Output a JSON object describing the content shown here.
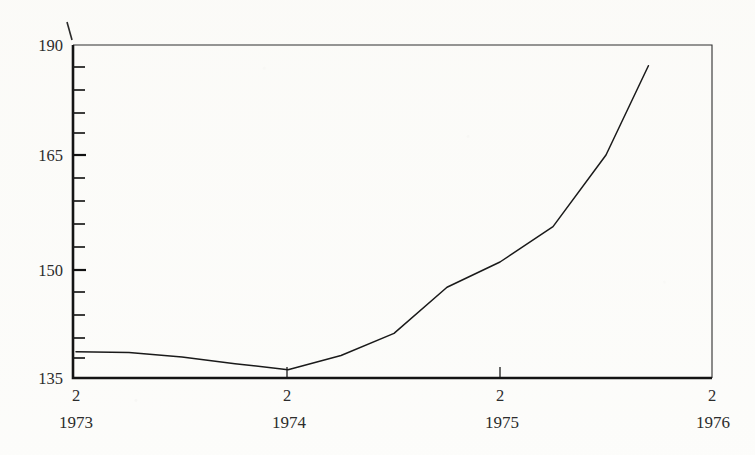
{
  "chart_data": {
    "type": "line",
    "title": "",
    "subtitle": "",
    "xlabel": "",
    "ylabel": "",
    "grid": false,
    "legend": false,
    "legend_position": "none",
    "axis_marker": "I",
    "ylim": [
      135,
      190
    ],
    "y_scale": "log",
    "y_tick_labels": [
      "190",
      "165",
      "150",
      "135"
    ],
    "y_labeled_values": [
      190,
      165,
      150,
      135
    ],
    "y_minor_tick_count": 14,
    "xlim": [
      1973.25,
      1976.25
    ],
    "x_tick_labels": [
      "2",
      "2",
      "2",
      "2"
    ],
    "x_year_labels": [
      "1973",
      "1974",
      "1975",
      "1976"
    ],
    "x_tick_values": [
      1973.25,
      1974.25,
      1975.25,
      1976.25
    ],
    "series": [
      {
        "name": "index",
        "x": [
          1973.25,
          1973.5,
          1973.75,
          1974.0,
          1974.25,
          1974.5,
          1974.75,
          1975.0,
          1975.25,
          1975.5,
          1975.75
        ],
        "values": [
          138.5,
          138.4,
          137.8,
          136.9,
          136.1,
          138.0,
          141.0,
          147.5,
          151.0,
          155.5,
          165.0
        ]
      }
    ],
    "series_end_point": {
      "x": 1975.95,
      "value": 185.0
    },
    "colors": {
      "line": "#1a1a1a",
      "axis": "#141414",
      "text": "#2c2c2c",
      "background": "#fcfcfa"
    }
  }
}
